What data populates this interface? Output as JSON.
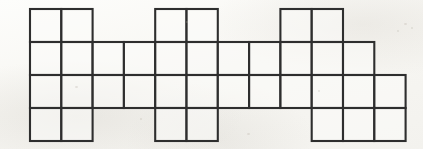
{
  "figure": {
    "background_color": "#fbfbf9",
    "line_color": "#2e2e2e",
    "cell_fill_color": "#fcfcfa",
    "line_width": 2.1,
    "origin_x": 30,
    "origin_y": 9,
    "cell_width": 31.3,
    "cell_height": 33,
    "columns": 12,
    "rows": 4,
    "total_cells": 35,
    "row_labels": [
      "row-1",
      "row-2",
      "row-3",
      "row-4"
    ],
    "column_labels": [
      "1",
      "2",
      "3",
      "4",
      "5",
      "6",
      "7",
      "8",
      "9",
      "10",
      "11",
      "12"
    ],
    "filled_cells": [
      {
        "row": 1,
        "columns": [
          1,
          2,
          5,
          6,
          9,
          10
        ]
      },
      {
        "row": 2,
        "columns": [
          1,
          2,
          3,
          4,
          5,
          6,
          7,
          8,
          9,
          10,
          11
        ]
      },
      {
        "row": 3,
        "columns": [
          1,
          2,
          3,
          4,
          5,
          6,
          7,
          8,
          9,
          10,
          11,
          12
        ]
      },
      {
        "row": 4,
        "columns": [
          1,
          2,
          5,
          6,
          10,
          11,
          12
        ]
      }
    ],
    "specks": [
      {
        "x": 404,
        "y": 23,
        "w": 3,
        "h": 2
      },
      {
        "x": 411,
        "y": 27,
        "w": 2,
        "h": 2
      },
      {
        "x": 397,
        "y": 30,
        "w": 2,
        "h": 2
      },
      {
        "x": 75,
        "y": 86,
        "w": 3,
        "h": 2
      },
      {
        "x": 140,
        "y": 118,
        "w": 2,
        "h": 2
      },
      {
        "x": 247,
        "y": 133,
        "w": 3,
        "h": 2
      },
      {
        "x": 318,
        "y": 90,
        "w": 2,
        "h": 2
      },
      {
        "x": 186,
        "y": 21,
        "w": 2,
        "h": 2
      }
    ]
  }
}
